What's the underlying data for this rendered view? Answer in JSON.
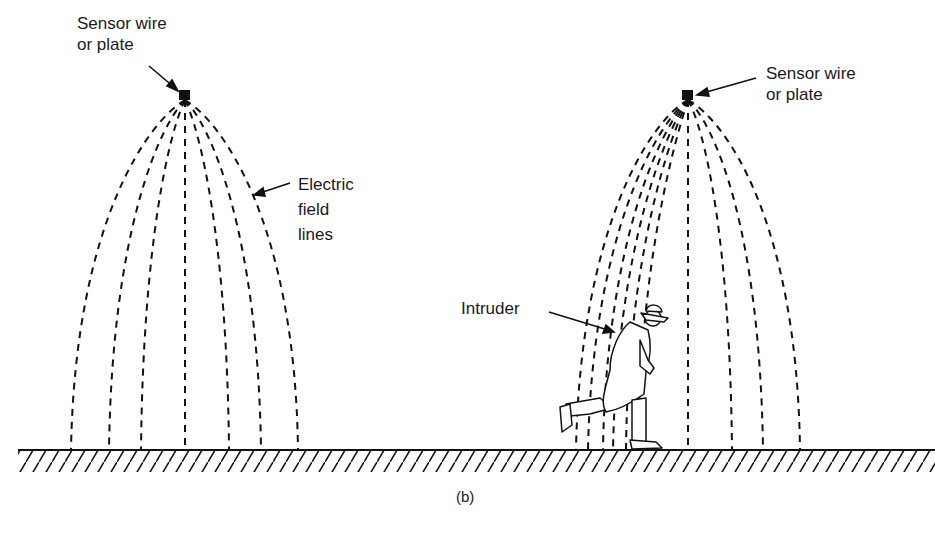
{
  "labels": {
    "left_sensor": [
      "Sensor wire",
      "or plate"
    ],
    "right_sensor": [
      "Sensor wire",
      "or plate"
    ],
    "field_lines": [
      "Electric",
      "field",
      "lines"
    ],
    "intruder": "Intruder"
  },
  "caption": "(b)",
  "colors": {
    "ink": "#111111",
    "background": "#ffffff"
  },
  "scene": {
    "ground_y": 450,
    "left_plate": {
      "x": 185,
      "y": 96
    },
    "right_plate": {
      "x": 688,
      "y": 96
    },
    "left_line_feet": [
      71,
      109,
      141,
      185,
      229,
      261,
      298
    ],
    "right_line_feet_distorted": [
      576,
      588,
      603,
      613
    ],
    "right_line_feet_normal": [
      688,
      732,
      763,
      800
    ]
  }
}
